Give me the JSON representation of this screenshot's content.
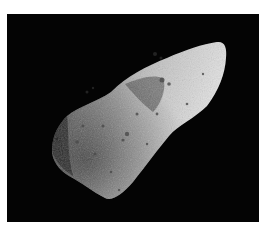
{
  "image": {
    "subject": "asteroid",
    "alt": "Grayscale photograph of an elongated, cratered asteroid against a black background",
    "background_color": "#040404",
    "page_color": "#ffffff"
  }
}
